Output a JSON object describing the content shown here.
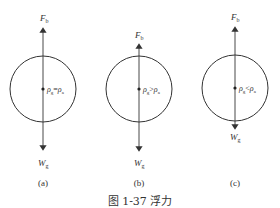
{
  "figure": {
    "caption": "图 1-37   浮力",
    "panels": [
      {
        "id": "a",
        "label": "(a)",
        "force_up": "F",
        "force_up_sub": "b",
        "force_down": "W",
        "force_down_sub": "g",
        "relation_lhs": "ρ",
        "relation_lhs_sub": "g",
        "relation_op": "=",
        "relation_rhs": "ρ",
        "relation_rhs_sub": "a"
      },
      {
        "id": "b",
        "label": "(b)",
        "force_up": "F",
        "force_up_sub": "b",
        "force_down": "W",
        "force_down_sub": "g",
        "relation_lhs": "ρ",
        "relation_lhs_sub": "g",
        "relation_op": ">",
        "relation_rhs": "ρ",
        "relation_rhs_sub": "a"
      },
      {
        "id": "c",
        "label": "(c)",
        "force_up": "F",
        "force_up_sub": "b",
        "force_down": "W",
        "force_down_sub": "g",
        "relation_lhs": "ρ",
        "relation_lhs_sub": "g",
        "relation_op": "<",
        "relation_rhs": "ρ",
        "relation_rhs_sub": "a"
      }
    ],
    "colors": {
      "stroke": "#333333",
      "background": "#ffffff"
    }
  }
}
